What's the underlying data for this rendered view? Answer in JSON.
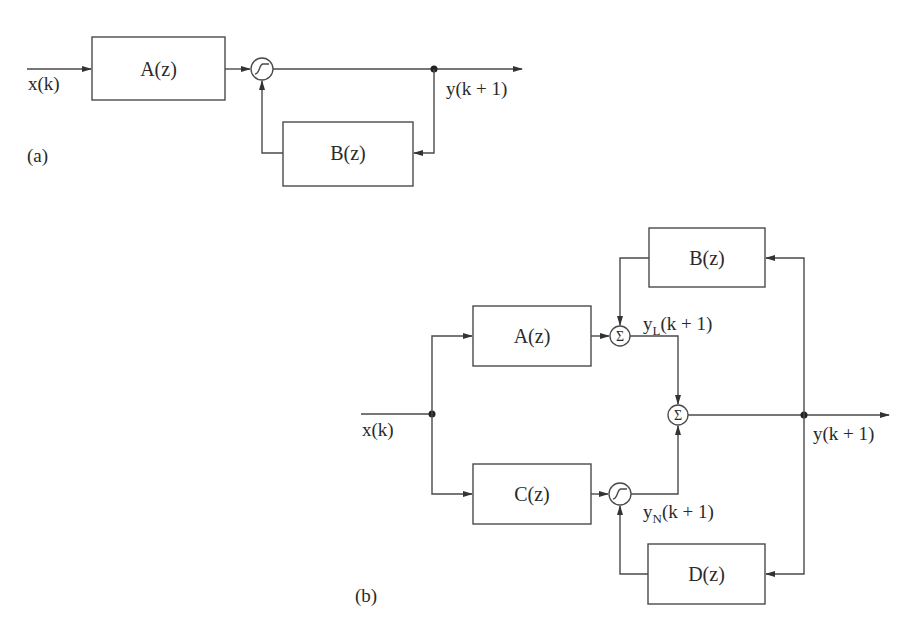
{
  "diagram_a": {
    "panel_label": "(a)",
    "input_label": "x(k)",
    "output_label": "y(k + 1)",
    "blocks": {
      "forward": "A(z)",
      "feedback": "B(z)"
    },
    "nodes": {
      "nonlinear": "sigmoid-node"
    }
  },
  "diagram_b": {
    "panel_label": "(b)",
    "input_label": "x(k)",
    "output_label": "y(k + 1)",
    "blocks": {
      "linear_forward": "A(z)",
      "linear_feedback": "B(z)",
      "nonlinear_forward": "C(z)",
      "nonlinear_feedback": "D(z)"
    },
    "signals": {
      "linear_output": {
        "base": "y",
        "subscript": "L",
        "rest": "(k + 1)"
      },
      "nonlinear_output": {
        "base": "y",
        "subscript": "N",
        "rest": "(k + 1)"
      }
    },
    "nodes": {
      "sum_symbol": "Σ",
      "linear_sum": "summing-junction",
      "output_sum": "summing-junction",
      "nonlinear": "sigmoid-node"
    }
  }
}
